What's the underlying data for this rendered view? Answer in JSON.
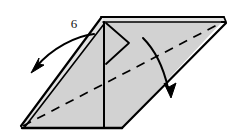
{
  "figure": {
    "type": "origami-fold-diagram",
    "step_number": "6",
    "background_color": "#ffffff",
    "paper_fill": "#d2d2d2",
    "paper_fill_light": "#e2e2e2",
    "line_color": "#000000",
    "fold_line_style": "dashed",
    "labels": {
      "step": "6"
    },
    "annotations": [
      {
        "name": "left-fold-arrow",
        "direction": "down-left",
        "description": "curved arrow pointing down-left"
      },
      {
        "name": "right-fold-arrow",
        "direction": "down",
        "description": "curved arrow pointing down-right"
      }
    ],
    "shapes": {
      "outline": "large parallelogram / open book form seen in perspective",
      "crease": "long dashed valley fold from lower-left vertex to upper-right tip",
      "inner_flap": "small triangular flap near the top-left panel",
      "center_spine": "vertical spine line down the middle"
    }
  }
}
